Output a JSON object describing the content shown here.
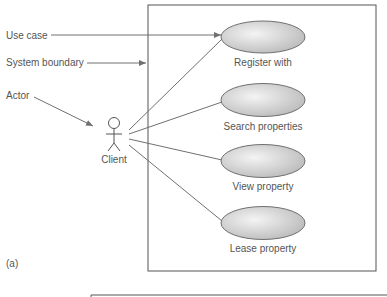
{
  "figure": {
    "panel_label": "(a)",
    "callouts": [
      {
        "label": "Use case"
      },
      {
        "label": "System boundary"
      },
      {
        "label": "Actor"
      }
    ],
    "actor": {
      "label": "Client"
    },
    "use_cases": [
      {
        "label": "Register with"
      },
      {
        "label": "Search properties"
      },
      {
        "label": "View property"
      },
      {
        "label": "Lease property"
      }
    ],
    "colors": {
      "line": "#707070",
      "boundary": "#555555",
      "ellipse_fill_light": "#f2f2f2",
      "ellipse_fill_dark": "#bdbdbd",
      "text": "#555555"
    }
  }
}
